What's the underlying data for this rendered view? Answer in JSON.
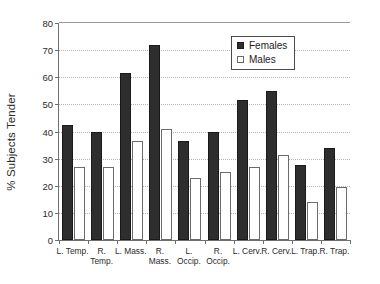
{
  "chart_data": {
    "type": "bar",
    "title": "",
    "xlabel": "",
    "ylabel": "% Subjects Tender",
    "ylim": [
      0,
      80
    ],
    "ytick_step": 10,
    "yticks": [
      0,
      10,
      20,
      30,
      40,
      50,
      60,
      70,
      80
    ],
    "grid": true,
    "grid_axis": "y",
    "legend_position": "top-right",
    "categories": [
      "L. Temp.",
      "R. Temp.",
      "L. Mass.",
      "R. Mass.",
      "L. Occip.",
      "R. Occip.",
      "L. Cerv.",
      "R. Cerv.",
      "L. Trap.",
      "R. Trap."
    ],
    "series": [
      {
        "name": "Females",
        "color": "#2e2e2e",
        "values": [
          42.5,
          40,
          61.5,
          72,
          36.5,
          40,
          51.5,
          55,
          27.5,
          34
        ]
      },
      {
        "name": "Males",
        "color": "#ffffff",
        "values": [
          27,
          27,
          36.5,
          41,
          23,
          25,
          27,
          31.5,
          14,
          19.5
        ]
      }
    ]
  },
  "legend": {
    "entries": [
      {
        "label": "Females",
        "swatch": "filled-square-icon"
      },
      {
        "label": "Males",
        "swatch": "open-square-icon"
      }
    ]
  },
  "axis_labels": {
    "y_title": "% Subjects Tender"
  }
}
